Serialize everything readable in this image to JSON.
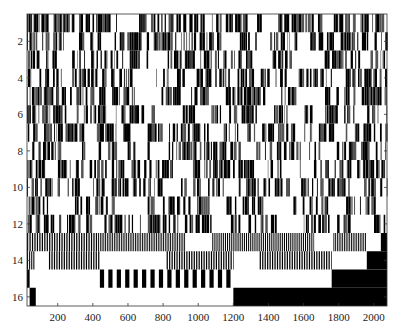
{
  "chart_data": {
    "type": "heatmap",
    "title": "",
    "xlabel": "",
    "ylabel": "",
    "colormap": [
      "#ffffff",
      "#000000"
    ],
    "xlim": [
      25,
      2075
    ],
    "ylim": [
      0.5,
      16.5
    ],
    "y_reversed": true,
    "grid": false,
    "xticks": [
      200,
      400,
      600,
      800,
      1000,
      1200,
      1400,
      1600,
      1800,
      2000
    ],
    "xtick_labels": [
      "200",
      "400",
      "600",
      "800",
      "1000",
      "1200",
      "1400",
      "1600",
      "1800",
      "2000"
    ],
    "yticks": [
      2,
      4,
      6,
      8,
      10,
      12,
      14,
      16
    ],
    "ytick_labels": [
      "2",
      "4",
      "6",
      "8",
      "10",
      "12",
      "14",
      "16"
    ],
    "rows": [
      {
        "row": 1,
        "pattern": "dense-random",
        "density": 0.55,
        "seed": 11,
        "gaps": [
          [
            575,
            650
          ],
          [
            1275,
            1330
          ],
          [
            1360,
            1420
          ],
          [
            1700,
            1760
          ]
        ]
      },
      {
        "row": 2,
        "pattern": "dense-random",
        "density": 0.5,
        "seed": 23,
        "gaps": [
          [
            240,
            320
          ],
          [
            440,
            480
          ],
          [
            1150,
            1230
          ],
          [
            1350,
            1400
          ],
          [
            1560,
            1620
          ]
        ]
      },
      {
        "row": 3,
        "pattern": "dense-random",
        "density": 0.45,
        "seed": 37,
        "gaps": [
          [
            190,
            260
          ],
          [
            730,
            790
          ],
          [
            1320,
            1400
          ],
          [
            1560,
            1700
          ],
          [
            1920,
            1980
          ]
        ]
      },
      {
        "row": 4,
        "pattern": "dense-random",
        "density": 0.45,
        "seed": 41,
        "gaps": [
          [
            620,
            760
          ],
          [
            920,
            980
          ],
          [
            1500,
            1560
          ],
          [
            1760,
            1840
          ]
        ]
      },
      {
        "row": 5,
        "pattern": "dense-random",
        "density": 0.5,
        "seed": 53,
        "gaps": [
          [
            640,
            780
          ],
          [
            900,
            960
          ],
          [
            1080,
            1140
          ],
          [
            1390,
            1450
          ],
          [
            1610,
            1700
          ]
        ]
      },
      {
        "row": 6,
        "pattern": "dense-random",
        "density": 0.45,
        "seed": 67,
        "gaps": [
          [
            800,
            880
          ],
          [
            1010,
            1070
          ],
          [
            1330,
            1420
          ],
          [
            1660,
            1720
          ],
          [
            1900,
            1960
          ]
        ]
      },
      {
        "row": 7,
        "pattern": "dense-random",
        "density": 0.5,
        "seed": 71,
        "gaps": [
          [
            340,
            420
          ],
          [
            620,
            700
          ],
          [
            1060,
            1140
          ],
          [
            1540,
            1600
          ],
          [
            1780,
            1840
          ]
        ]
      },
      {
        "row": 8,
        "pattern": "dense-random",
        "density": 0.45,
        "seed": 83,
        "gaps": [
          [
            220,
            330
          ],
          [
            740,
            830
          ],
          [
            1240,
            1330
          ],
          [
            1700,
            1780
          ]
        ]
      },
      {
        "row": 9,
        "pattern": "dense-random",
        "density": 0.5,
        "seed": 97,
        "gaps": [
          [
            130,
            200
          ],
          [
            860,
            960
          ],
          [
            1320,
            1380
          ],
          [
            1580,
            1640
          ]
        ]
      },
      {
        "row": 10,
        "pattern": "dense-random",
        "density": 0.45,
        "seed": 101,
        "gaps": [
          [
            330,
            400
          ],
          [
            790,
            900
          ],
          [
            1150,
            1230
          ],
          [
            1520,
            1580
          ],
          [
            1870,
            1930
          ]
        ]
      },
      {
        "row": 11,
        "pattern": "dense-random",
        "density": 0.45,
        "seed": 113,
        "gaps": [
          [
            150,
            290
          ],
          [
            520,
            700
          ],
          [
            1060,
            1160
          ],
          [
            1380,
            1520
          ],
          [
            1760,
            1840
          ]
        ]
      },
      {
        "row": 12,
        "pattern": "dense-random",
        "density": 0.45,
        "seed": 127,
        "gaps": [
          [
            400,
            460
          ],
          [
            1090,
            1180
          ],
          [
            1450,
            1600
          ],
          [
            1860,
            1990
          ]
        ]
      },
      {
        "row": 13,
        "pattern": "segments",
        "segments": [
          {
            "from": 25,
            "to": 430,
            "type": "stripes",
            "period": 14
          },
          {
            "from": 430,
            "to": 930,
            "type": "stripes",
            "period": 10
          },
          {
            "from": 930,
            "to": 1080,
            "type": "white"
          },
          {
            "from": 1080,
            "to": 1660,
            "type": "stripes",
            "period": 12
          },
          {
            "from": 1660,
            "to": 1770,
            "type": "white"
          },
          {
            "from": 1770,
            "to": 1960,
            "type": "stripes",
            "period": 10
          },
          {
            "from": 1960,
            "to": 2040,
            "type": "white"
          },
          {
            "from": 2040,
            "to": 2075,
            "type": "black"
          }
        ]
      },
      {
        "row": 14,
        "pattern": "segments",
        "segments": [
          {
            "from": 25,
            "to": 70,
            "type": "stripes",
            "period": 12
          },
          {
            "from": 70,
            "to": 150,
            "type": "white"
          },
          {
            "from": 150,
            "to": 440,
            "type": "stripes",
            "period": 14
          },
          {
            "from": 440,
            "to": 820,
            "type": "white"
          },
          {
            "from": 820,
            "to": 1200,
            "type": "stripes",
            "period": 14
          },
          {
            "from": 1200,
            "to": 1350,
            "type": "white"
          },
          {
            "from": 1350,
            "to": 1760,
            "type": "stripes",
            "period": 14
          },
          {
            "from": 1760,
            "to": 1960,
            "type": "white"
          },
          {
            "from": 1960,
            "to": 2075,
            "type": "black"
          }
        ]
      },
      {
        "row": 15,
        "pattern": "segments",
        "segments": [
          {
            "from": 25,
            "to": 40,
            "type": "black"
          },
          {
            "from": 40,
            "to": 440,
            "type": "white"
          },
          {
            "from": 440,
            "to": 1200,
            "type": "stripes",
            "period": 48
          },
          {
            "from": 1200,
            "to": 1760,
            "type": "white"
          },
          {
            "from": 1760,
            "to": 2075,
            "type": "black"
          }
        ]
      },
      {
        "row": 16,
        "pattern": "segments",
        "segments": [
          {
            "from": 25,
            "to": 40,
            "type": "white"
          },
          {
            "from": 40,
            "to": 75,
            "type": "black"
          },
          {
            "from": 75,
            "to": 1200,
            "type": "white"
          },
          {
            "from": 1200,
            "to": 2075,
            "type": "black"
          }
        ]
      }
    ]
  },
  "layout": {
    "plot_left": 27,
    "plot_right": 387,
    "plot_top": 14,
    "plot_bottom": 306
  }
}
